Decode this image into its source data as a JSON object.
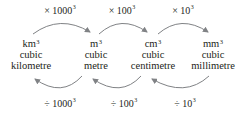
{
  "units": [
    {
      "symbol": "km",
      "power": "3",
      "line1": "cubic",
      "line2": "kilometre"
    },
    {
      "symbol": "m",
      "power": "3",
      "line1": "cubic",
      "line2": "metre"
    },
    {
      "symbol": "cm",
      "power": "3",
      "line1": "cubic",
      "line2": "centimetre"
    },
    {
      "symbol": "mm",
      "power": "3",
      "line1": "cubic",
      "line2": "millimetre"
    }
  ],
  "multiply_labels": [
    {
      "op": "×",
      "base": "1000",
      "power": "3"
    },
    {
      "op": "×",
      "base": "100",
      "power": "3"
    },
    {
      "op": "×",
      "base": "10",
      "power": "3"
    }
  ],
  "divide_labels": [
    {
      "op": "÷",
      "base": "1000",
      "power": "3"
    },
    {
      "op": "÷",
      "base": "100",
      "power": "3"
    },
    {
      "op": "÷",
      "base": "10",
      "power": "3"
    }
  ],
  "colors": {
    "text": "#231f20",
    "arrow": "#808285"
  }
}
